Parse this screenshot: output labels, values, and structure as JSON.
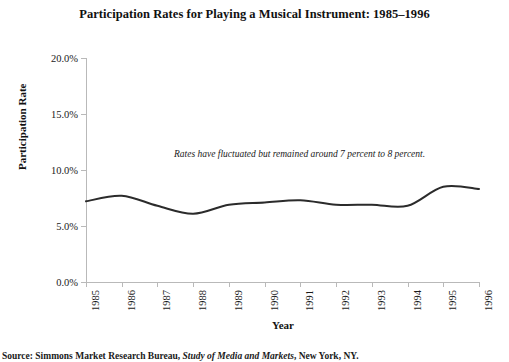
{
  "chart_data": {
    "type": "line",
    "title": "Participation Rates for Playing a Musical Instrument: 1985–1996",
    "xlabel": "Year",
    "ylabel": "Participation Rate",
    "categories": [
      "1985",
      "1986",
      "1987",
      "1988",
      "1989",
      "1990",
      "1991",
      "1992",
      "1993",
      "1994",
      "1995",
      "1996"
    ],
    "x": [
      1985,
      1986,
      1987,
      1988,
      1989,
      1990,
      1991,
      1992,
      1993,
      1994,
      1995,
      1996
    ],
    "values": [
      7.2,
      7.7,
      6.8,
      6.1,
      6.9,
      7.1,
      7.3,
      6.9,
      6.9,
      6.8,
      8.5,
      8.3
    ],
    "series": [
      {
        "name": "Participation Rate",
        "values": [
          7.2,
          7.7,
          6.8,
          6.1,
          6.9,
          7.1,
          7.3,
          6.9,
          6.9,
          6.8,
          8.5,
          8.3
        ]
      }
    ],
    "ylim": [
      0,
      20
    ],
    "xlim": [
      1985,
      1996
    ],
    "ytick_labels": [
      "0.0%",
      "5.0%",
      "10.0%",
      "15.0%",
      "20.0%"
    ],
    "ytick_values": [
      0,
      5,
      10,
      15,
      20
    ],
    "grid": false,
    "legend": false,
    "legend_position": "none",
    "line_color": "#2b2b2b",
    "line_width": 2.0,
    "smoothing": "spline",
    "annotations": [
      {
        "text": "Rates have fluctuated but remained around 7 percent to 8 percent.",
        "style": "italic",
        "x": 1989.2,
        "y": 10.0
      }
    ]
  },
  "figure": {
    "background": "#ffffff",
    "axis_color": "#b9b9b9",
    "text_color": "#1a1a1a"
  },
  "source": {
    "prefix": "Source: Simmons Market Research Bureau, ",
    "work": "Study of Media and Markets",
    "suffix": ", New York, NY."
  }
}
